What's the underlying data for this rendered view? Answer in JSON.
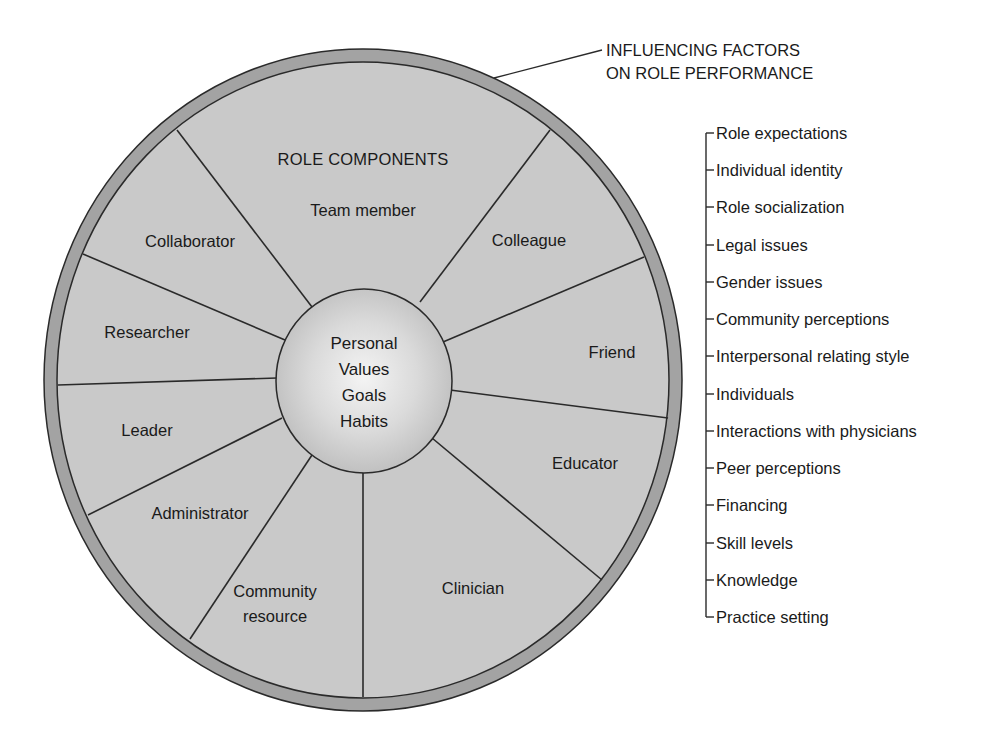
{
  "diagram": {
    "title": "ROLE COMPONENTS",
    "callout": {
      "line1": "INFLUENCING FACTORS",
      "line2": "ON ROLE PERFORMANCE"
    },
    "center": {
      "lines": [
        "Personal",
        "Values",
        "Goals",
        "Habits"
      ]
    },
    "role_components": [
      {
        "label": "Team member"
      },
      {
        "label": "Colleague"
      },
      {
        "label": "Friend"
      },
      {
        "label": "Educator"
      },
      {
        "label": "Clinician"
      },
      {
        "label_line1": "Community",
        "label_line2": "resource"
      },
      {
        "label": "Administrator"
      },
      {
        "label": "Leader"
      },
      {
        "label": "Researcher"
      },
      {
        "label": "Collaborator"
      }
    ],
    "influencing_factors": [
      "Role expectations",
      "Individual identity",
      "Role socialization",
      "Legal issues",
      "Gender issues",
      "Community perceptions",
      "Interpersonal relating style",
      "Individuals",
      "Interactions with physicians",
      "Peer perceptions",
      "Financing",
      "Skill levels",
      "Knowledge",
      "Practice setting"
    ],
    "colors": {
      "wheel_fill": "#c9c9c9",
      "ring_fill": "#a3a3a3",
      "center_light": "#f2f2f2",
      "center_dark": "#c2c2c2",
      "stroke": "#2a2a2a"
    }
  }
}
